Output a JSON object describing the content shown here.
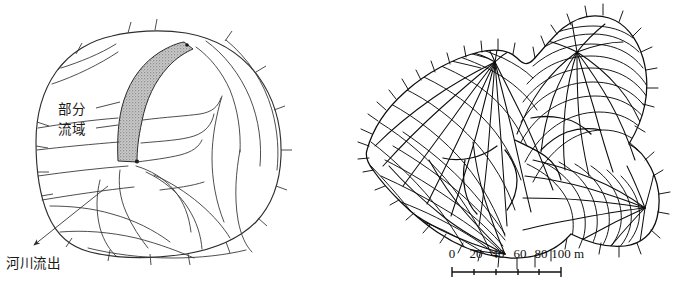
{
  "figure": {
    "background_color": "#ffffff",
    "ink_color": "#111111",
    "shade_color": "#b8b8b8"
  },
  "left_panel": {
    "name": "schematic-watershed-diagram",
    "labels": {
      "partial_watershed_line1": "部分",
      "partial_watershed_line2": "流域",
      "river_outflow": "河川流出"
    },
    "shaded_region_label": "部分流域",
    "outflow_arrow_label": "河川流出"
  },
  "right_panel": {
    "name": "flow-net-mesh-map",
    "scale": {
      "ticks": [
        "0",
        "20",
        "40",
        "60",
        "80",
        "100"
      ],
      "unit": "m",
      "full_label": "0 20 40 60 80 100 m"
    }
  }
}
